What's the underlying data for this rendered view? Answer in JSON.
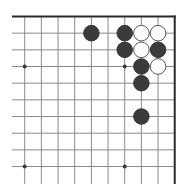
{
  "board": {
    "description": "Go board corner diagram (top-right corner, 10x10 visible section)",
    "visible_columns": 10,
    "visible_rows": 10,
    "edges": [
      "top",
      "right"
    ],
    "colors": {
      "black_stone": "#3b3b3b",
      "white_stone": "#ffffff",
      "line": "#8a8a8a",
      "edge": "#2a2a2a"
    },
    "star_points": [
      {
        "col": 0,
        "row": 3
      },
      {
        "col": 6,
        "row": 3
      },
      {
        "col": 0,
        "row": 9
      },
      {
        "col": 6,
        "row": 9
      }
    ],
    "stones": [
      {
        "color": "black",
        "col": 4,
        "row": 1
      },
      {
        "color": "black",
        "col": 6,
        "row": 1
      },
      {
        "color": "white",
        "col": 7,
        "row": 1
      },
      {
        "color": "white",
        "col": 8,
        "row": 1
      },
      {
        "color": "black",
        "col": 6,
        "row": 2
      },
      {
        "color": "white",
        "col": 7,
        "row": 2
      },
      {
        "color": "black",
        "col": 8,
        "row": 2
      },
      {
        "color": "black",
        "col": 7,
        "row": 3
      },
      {
        "color": "white",
        "col": 8,
        "row": 3
      },
      {
        "color": "black",
        "col": 7,
        "row": 4
      },
      {
        "color": "black",
        "col": 7,
        "row": 6
      }
    ]
  }
}
